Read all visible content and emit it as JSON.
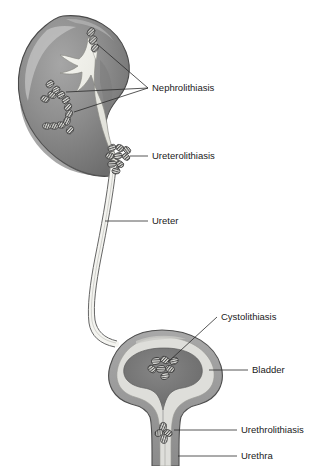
{
  "figure": {
    "background_color": "#ffffff"
  },
  "colors": {
    "kidney_cortex": "#8d8d8d",
    "kidney_cortex_dark": "#6f6f6f",
    "kidney_highlight": "#b4b4b4",
    "kidney_pelvis": "#efefe9",
    "kidney_outline": "#4a4a4a",
    "ureter_fill": "#f2f2ee",
    "ureter_outline": "#6b6b6b",
    "bladder_wall": "#9a9a9a",
    "bladder_lumen": "#dededa",
    "bladder_inner": "#757575",
    "stone_fill": "#d8d8d4",
    "stone_outline": "#3a3a3a",
    "label_text": "#1a1a1a",
    "leader_line": "#2b2b2b"
  },
  "labels": [
    {
      "id": "nephrolithiasis",
      "text": "Nephrolithiasis",
      "x": 152,
      "y": 88
    },
    {
      "id": "ureterolithiasis",
      "text": "Ureterolithiasis",
      "x": 152,
      "y": 156
    },
    {
      "id": "ureter",
      "text": "Ureter",
      "x": 152,
      "y": 221
    },
    {
      "id": "cystolithiasis",
      "text": "Cystolithiasis",
      "x": 221,
      "y": 317
    },
    {
      "id": "bladder",
      "text": "Bladder",
      "x": 252,
      "y": 370
    },
    {
      "id": "urethrolithiasis",
      "text": "Urethrolithiasis",
      "x": 241,
      "y": 430
    },
    {
      "id": "urethra",
      "text": "Urethra",
      "x": 241,
      "y": 456
    }
  ],
  "anatomy": {
    "kidney": {
      "name": "kidney",
      "description": "left kidney, coronal section, bean shaped"
    },
    "renal_pelvis": {
      "name": "renal-pelvis",
      "description": "pale collecting system with calyces"
    },
    "ureter": {
      "name": "ureter",
      "description": "long thin tube descending to bladder"
    },
    "bladder": {
      "name": "bladder",
      "description": "urinary bladder with thick wall and lumen"
    },
    "urethra": {
      "name": "urethra",
      "description": "tube below bladder neck"
    }
  },
  "stone_groups": [
    {
      "id": "renal-calyx-upper",
      "label_ref": "nephrolithiasis",
      "count": 3
    },
    {
      "id": "staghorn-branch",
      "label_ref": "nephrolithiasis",
      "count": 13
    },
    {
      "id": "ureteropelvic-junction",
      "label_ref": "ureterolithiasis",
      "count": 9
    },
    {
      "id": "bladder-stones",
      "label_ref": "cystolithiasis",
      "count": 7
    },
    {
      "id": "urethral-stone",
      "label_ref": "urethrolithiasis",
      "count": 4
    }
  ]
}
